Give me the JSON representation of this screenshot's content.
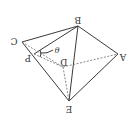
{
  "diagram": {
    "orientation": "rotated 180 degrees",
    "colors": {
      "line": "#3a3a3a",
      "dashed": "#6a6a6a",
      "text": "#333333"
    },
    "labels": {
      "A": "A",
      "B": "B",
      "C": "C",
      "D": "D",
      "E": "E",
      "P": "P",
      "theta": "θ"
    },
    "solid_edges": [
      "C-B",
      "B-A",
      "B-P",
      "B-E",
      "A-E",
      "C-E"
    ],
    "dashed_edges": [
      "C-D",
      "D-A",
      "D-E",
      "P-D"
    ]
  }
}
